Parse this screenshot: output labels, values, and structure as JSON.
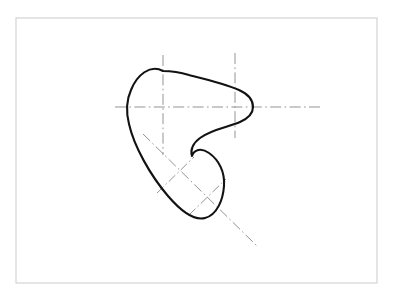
{
  "figure": {
    "background_color": "#ffffff",
    "width": 395,
    "height": 299
  },
  "frame": {
    "name": "drawing-border",
    "x": 16,
    "y": 18,
    "width": 361,
    "height": 265,
    "stroke_color": "#cfcfcf",
    "fill_color": "#ffffff"
  },
  "outline": {
    "name": "cam-profile",
    "stroke_color": "#121212",
    "stroke_width": 2.1,
    "fill": "none",
    "closed": true,
    "path": "M 163 71 C 150 64 137 75 131 90 C 126 101 126 112 129 124 C 134 146 150 175 168 196 C 180 210 193 221 205 218 C 217 215 223 200 224 186 C 225 172 219 160 209 153 C 201 147 194 150 192 156 C 190 150 193 143 200 138 C 212 129 229 127 240 122 C 249 118 253 113 253 107 C 253 100 248 94 239 90 C 226 84 205 79 189 75 C 179 72 170 71 163 71 Z",
    "key_points": {
      "top_apex": [
        163,
        71
      ],
      "left_bulge": [
        127,
        105
      ],
      "nose_right": [
        253,
        107
      ],
      "inflection": [
        196,
        150
      ],
      "bottom_tip": [
        205,
        218
      ]
    }
  },
  "centerlines": {
    "stroke_color": "#8d8d8d",
    "stroke_width": 0.95,
    "items": [
      {
        "name": "horizontal-centerline",
        "orientation": "horizontal",
        "x1": 115,
        "y1": 107,
        "x2": 320,
        "y2": 107
      },
      {
        "name": "vertical-centerline-left",
        "orientation": "vertical",
        "x1": 163,
        "y1": 55,
        "x2": 163,
        "y2": 155
      },
      {
        "name": "vertical-centerline-right",
        "orientation": "vertical",
        "x1": 235,
        "y1": 53,
        "x2": 235,
        "y2": 138
      },
      {
        "name": "diagonal-centerline",
        "orientation": "diagonal",
        "x1": 143,
        "y1": 134,
        "x2": 258,
        "y2": 247
      },
      {
        "name": "diagonal-cross-tick-upper",
        "orientation": "perpendicular",
        "x1": 157,
        "y1": 193,
        "x2": 194,
        "y2": 157
      },
      {
        "name": "diagonal-cross-tick-lower",
        "orientation": "perpendicular",
        "x1": 189,
        "y1": 215,
        "x2": 226,
        "y2": 179
      }
    ]
  }
}
